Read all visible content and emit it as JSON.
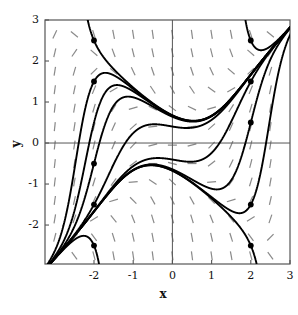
{
  "figure": {
    "type": "slope-field-plot",
    "background": "#ffffff",
    "frame_color": "#555555",
    "axis_color": "#555555",
    "curve_color": "#000000",
    "slope_mark_color": "#8a8a8a",
    "marker_color": "#000000"
  },
  "chart_data": {
    "type": "line",
    "title": "",
    "subtitle": "",
    "xlabel": "x",
    "ylabel": "y",
    "xlim": [
      -3.25,
      3.0
    ],
    "ylim": [
      -2.95,
      3.0
    ],
    "grid": false,
    "legend": null,
    "xticks": [
      -2,
      -1,
      0,
      1,
      2,
      3
    ],
    "xtick_labels": [
      "-2",
      "-1",
      "0",
      "1",
      "2",
      "3"
    ],
    "yticks": [
      -2,
      -1,
      0,
      1,
      2,
      3
    ],
    "ytick_labels": [
      "-2",
      "-1",
      "0",
      "1",
      "2",
      "3"
    ],
    "equation": "dy/dx = x^2 - y^2",
    "slope_field": {
      "style": "dashed",
      "x_start": -3.0,
      "x_end": 3.0,
      "x_step": 0.5,
      "y_start": -2.75,
      "y_end": 2.75,
      "y_step": 0.45,
      "dash_length": 9,
      "color": "#8a8a8a"
    },
    "initial_condition_markers": [
      {
        "x": -2,
        "y": 2.5
      },
      {
        "x": -2,
        "y": 1.5
      },
      {
        "x": -2,
        "y": -0.5
      },
      {
        "x": -2,
        "y": -1.5
      },
      {
        "x": -2,
        "y": -2.5
      },
      {
        "x": 2,
        "y": 2.5
      },
      {
        "x": 2,
        "y": 1.5
      },
      {
        "x": 2,
        "y": 0.5
      },
      {
        "x": 2,
        "y": -1.5
      },
      {
        "x": 2,
        "y": -2.5
      }
    ],
    "series": [
      {
        "name": "solution-x-2-y-2.5",
        "x0": -2,
        "y0": 2.5
      },
      {
        "name": "solution-x-2-y-1.5",
        "x0": -2,
        "y0": 1.5
      },
      {
        "name": "solution-x-2-y-0.5",
        "x0": -2,
        "y0": 0.5
      },
      {
        "name": "solution-x-2-y--0.5",
        "x0": -2,
        "y0": -0.5
      },
      {
        "name": "solution-x-2-y--1.5",
        "x0": -2,
        "y0": -1.5
      },
      {
        "name": "solution-x-2-y--2.5",
        "x0": -2,
        "y0": -2.5
      },
      {
        "name": "solution-x2-y2.5",
        "x0": 2,
        "y0": 2.5
      },
      {
        "name": "solution-x2-y1.5",
        "x0": 2,
        "y0": 1.5
      },
      {
        "name": "solution-x2-y0.5",
        "x0": 2,
        "y0": 0.5
      },
      {
        "name": "solution-x2-y--1.5",
        "x0": 2,
        "y0": -1.5
      },
      {
        "name": "solution-x2-y--2.5",
        "x0": 2,
        "y0": -2.5
      }
    ]
  }
}
